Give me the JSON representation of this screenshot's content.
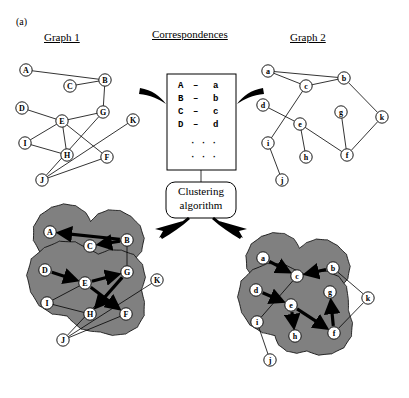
{
  "figure": {
    "panel_tag": "(a)",
    "headers": {
      "graph1": "Graph 1",
      "correspondences": "Correspondences",
      "graph2": "Graph 2"
    },
    "clustering_box": {
      "line1": "Clustering",
      "line2": "algorithm"
    },
    "correspondence_list": {
      "rows": [
        {
          "left": "A",
          "dash": "–",
          "right": "a"
        },
        {
          "left": "B",
          "dash": "–",
          "right": "b"
        },
        {
          "left": "C",
          "dash": "–",
          "right": "c"
        },
        {
          "left": "D",
          "dash": "–",
          "right": "d"
        }
      ],
      "ellipsis_rows": [
        "· · ·",
        "· · ·"
      ]
    },
    "colors": {
      "cluster_fill": "#808080",
      "stroke": "#000000",
      "background": "#ffffff"
    },
    "graph1": {
      "title": "Graph 1",
      "nodes": [
        {
          "id": "A",
          "label": "A",
          "x": 26,
          "y": 70
        },
        {
          "id": "C",
          "label": "C",
          "x": 70,
          "y": 86
        },
        {
          "id": "B",
          "label": "B",
          "x": 105,
          "y": 80
        },
        {
          "id": "D",
          "label": "D",
          "x": 22,
          "y": 108
        },
        {
          "id": "E",
          "label": "E",
          "x": 62,
          "y": 121
        },
        {
          "id": "G",
          "label": "G",
          "x": 103,
          "y": 112
        },
        {
          "id": "K",
          "label": "K",
          "x": 133,
          "y": 120
        },
        {
          "id": "I",
          "label": "I",
          "x": 25,
          "y": 143
        },
        {
          "id": "H",
          "label": "H",
          "x": 67,
          "y": 155
        },
        {
          "id": "F",
          "label": "F",
          "x": 107,
          "y": 157
        },
        {
          "id": "J",
          "label": "J",
          "x": 42,
          "y": 180
        }
      ],
      "edges": [
        [
          "A",
          "B"
        ],
        [
          "C",
          "B"
        ],
        [
          "B",
          "G"
        ],
        [
          "D",
          "E"
        ],
        [
          "E",
          "G"
        ],
        [
          "E",
          "H"
        ],
        [
          "E",
          "F"
        ],
        [
          "I",
          "E"
        ],
        [
          "I",
          "H"
        ],
        [
          "G",
          "J"
        ],
        [
          "J",
          "F"
        ],
        [
          "J",
          "K"
        ]
      ]
    },
    "graph2": {
      "title": "Graph 2",
      "nodes": [
        {
          "id": "a",
          "label": "a",
          "x": 268,
          "y": 71
        },
        {
          "id": "c",
          "label": "c",
          "x": 306,
          "y": 86
        },
        {
          "id": "b",
          "label": "b",
          "x": 344,
          "y": 78
        },
        {
          "id": "d",
          "label": "d",
          "x": 263,
          "y": 105
        },
        {
          "id": "e",
          "label": "e",
          "x": 300,
          "y": 124
        },
        {
          "id": "g",
          "label": "g",
          "x": 341,
          "y": 112
        },
        {
          "id": "k",
          "label": "k",
          "x": 382,
          "y": 117
        },
        {
          "id": "i",
          "label": "i",
          "x": 268,
          "y": 143
        },
        {
          "id": "h",
          "label": "h",
          "x": 306,
          "y": 157
        },
        {
          "id": "f",
          "label": "f",
          "x": 347,
          "y": 155
        },
        {
          "id": "j",
          "label": "j",
          "x": 282,
          "y": 180
        }
      ],
      "edges": [
        [
          "a",
          "c"
        ],
        [
          "a",
          "b"
        ],
        [
          "c",
          "b"
        ],
        [
          "c",
          "i"
        ],
        [
          "d",
          "e"
        ],
        [
          "e",
          "h"
        ],
        [
          "e",
          "f"
        ],
        [
          "g",
          "f"
        ],
        [
          "b",
          "k"
        ],
        [
          "k",
          "f"
        ],
        [
          "i",
          "j"
        ]
      ]
    },
    "clustered_graph1": {
      "nodes": [
        {
          "id": "A",
          "label": "A",
          "x": 50,
          "y": 232
        },
        {
          "id": "C",
          "label": "C",
          "x": 90,
          "y": 246
        },
        {
          "id": "B",
          "label": "B",
          "x": 127,
          "y": 240
        },
        {
          "id": "D",
          "label": "D",
          "x": 45,
          "y": 270
        },
        {
          "id": "E",
          "label": "E",
          "x": 85,
          "y": 283
        },
        {
          "id": "G",
          "label": "G",
          "x": 127,
          "y": 272
        },
        {
          "id": "K",
          "label": "K",
          "x": 157,
          "y": 280
        },
        {
          "id": "I",
          "label": "I",
          "x": 47,
          "y": 303
        },
        {
          "id": "H",
          "label": "H",
          "x": 90,
          "y": 314
        },
        {
          "id": "F",
          "label": "F",
          "x": 126,
          "y": 314
        },
        {
          "id": "J",
          "label": "J",
          "x": 63,
          "y": 340
        }
      ],
      "thin_edges": [
        [
          "C",
          "B"
        ],
        [
          "B",
          "G"
        ],
        [
          "I",
          "E"
        ],
        [
          "I",
          "H"
        ],
        [
          "G",
          "J"
        ],
        [
          "J",
          "F"
        ],
        [
          "J",
          "K"
        ]
      ],
      "thick_arrows": [
        {
          "from": "A",
          "to": "B",
          "reverse": true
        },
        {
          "from": "B",
          "to": "C"
        },
        {
          "from": "D",
          "to": "E"
        },
        {
          "from": "E",
          "to": "G"
        },
        {
          "from": "G",
          "to": "H"
        },
        {
          "from": "E",
          "to": "F"
        }
      ],
      "clusters": [
        {
          "name": "cluster-top",
          "members": [
            "A",
            "C",
            "B"
          ]
        },
        {
          "name": "cluster-bottom",
          "members": [
            "D",
            "E",
            "G",
            "H",
            "F"
          ]
        }
      ]
    },
    "clustered_graph2": {
      "nodes": [
        {
          "id": "a",
          "label": "a",
          "x": 263,
          "y": 258
        },
        {
          "id": "c",
          "label": "c",
          "x": 297,
          "y": 276
        },
        {
          "id": "b",
          "label": "b",
          "x": 333,
          "y": 268
        },
        {
          "id": "d",
          "label": "d",
          "x": 256,
          "y": 290
        },
        {
          "id": "e",
          "label": "e",
          "x": 291,
          "y": 305
        },
        {
          "id": "g",
          "label": "g",
          "x": 330,
          "y": 292
        },
        {
          "id": "k",
          "label": "k",
          "x": 368,
          "y": 298
        },
        {
          "id": "i",
          "label": "i",
          "x": 257,
          "y": 322
        },
        {
          "id": "h",
          "label": "h",
          "x": 295,
          "y": 336
        },
        {
          "id": "f",
          "label": "f",
          "x": 334,
          "y": 333
        },
        {
          "id": "j",
          "label": "j",
          "x": 270,
          "y": 360
        }
      ],
      "thin_edges": [
        [
          "c",
          "i"
        ],
        [
          "b",
          "k"
        ],
        [
          "k",
          "f"
        ],
        [
          "i",
          "j"
        ]
      ],
      "thick_arrows": [
        {
          "from": "a",
          "to": "c"
        },
        {
          "from": "b",
          "to": "c"
        },
        {
          "from": "d",
          "to": "e"
        },
        {
          "from": "e",
          "to": "h"
        },
        {
          "from": "f",
          "to": "g"
        },
        {
          "from": "e",
          "to": "f"
        }
      ],
      "clusters": [
        {
          "name": "cluster-top",
          "members": [
            "a",
            "c",
            "b"
          ]
        },
        {
          "name": "cluster-bottom",
          "members": [
            "d",
            "e",
            "g",
            "h",
            "f"
          ]
        }
      ]
    }
  }
}
